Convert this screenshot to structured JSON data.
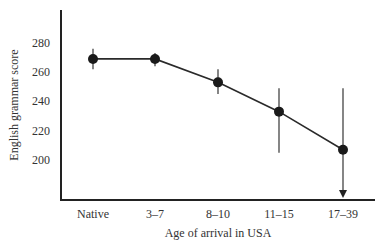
{
  "chart_data": {
    "type": "line",
    "title": "",
    "xlabel": "Age of arrival in USA",
    "ylabel": "English grammar score",
    "categories": [
      "Native",
      "3–7",
      "8–10",
      "11–15",
      "17–39"
    ],
    "series": [
      {
        "name": "English grammar score",
        "values": [
          269,
          269,
          253,
          233,
          207
        ],
        "error_low": [
          262,
          264,
          245,
          205,
          180
        ],
        "error_high": [
          276,
          273,
          262,
          249,
          249
        ]
      }
    ],
    "yticks": [
      200,
      220,
      240,
      260,
      280
    ],
    "ylim": [
      180,
      305
    ],
    "grid": false,
    "legend": "none",
    "annotations": [
      "Downward arrow on 17–39 error bar indicating lower bound extends below axis"
    ],
    "colors": {
      "line": "#2a2a2a",
      "marker": "#1a1a1a",
      "axis": "#222222"
    }
  }
}
